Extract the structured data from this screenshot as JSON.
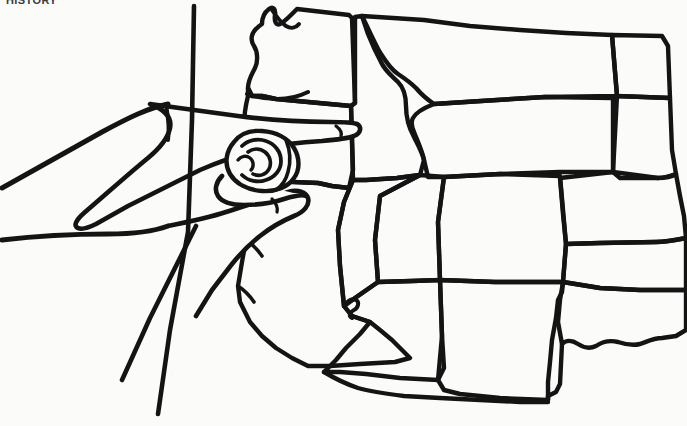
{
  "document": {
    "title": "Western United States outline map with pointing hand",
    "kind": "scanned line drawing",
    "background_color": "#fbfbfa",
    "ink_color": "#141414",
    "width_px": 687,
    "height_px": 426
  },
  "caption": {
    "clipped_header_text": "HISTORY",
    "note": "bold text fragment clipped at the very top edge of the scan"
  },
  "map": {
    "region_label": "Western United States",
    "style": "hand-drawn black outline, no fill, no labels printed on states",
    "states_depicted": [
      {
        "name": "Washington",
        "approx_center": [
          300,
          60
        ]
      },
      {
        "name": "Oregon",
        "approx_center": [
          288,
          145
        ]
      },
      {
        "name": "Idaho",
        "approx_center": [
          378,
          105
        ]
      },
      {
        "name": "Montana",
        "approx_center": [
          480,
          60
        ]
      },
      {
        "name": "North Dakota",
        "approx_center": [
          600,
          55
        ]
      },
      {
        "name": "South Dakota",
        "approx_center": [
          600,
          140
        ]
      },
      {
        "name": "Wyoming",
        "approx_center": [
          475,
          160
        ]
      },
      {
        "name": "Nebraska",
        "approx_center": [
          605,
          215
        ]
      },
      {
        "name": "Colorado",
        "approx_center": [
          490,
          245
        ]
      },
      {
        "name": "Kansas",
        "approx_center": [
          620,
          265
        ]
      },
      {
        "name": "Utah",
        "approx_center": [
          405,
          245
        ]
      },
      {
        "name": "Nevada",
        "approx_center": [
          330,
          250
        ]
      },
      {
        "name": "California",
        "approx_center": [
          280,
          285
        ]
      },
      {
        "name": "Arizona",
        "approx_center": [
          395,
          330
        ]
      },
      {
        "name": "New Mexico",
        "approx_center": [
          490,
          330
        ]
      },
      {
        "name": "Oklahoma",
        "approx_center": [
          620,
          330
        ]
      },
      {
        "name": "Texas panhandle",
        "approx_center": [
          590,
          385
        ]
      }
    ],
    "features": [
      "Puget Sound / Olympic Peninsula notch at upper left of Washington",
      "Snake River bend forming the Idaho panhandle and Oregon border",
      "Wyoming and Colorado drawn as near rectangles",
      "Four Corners junction where Utah, Colorado, Arizona and New Mexico meet",
      "Pacific coastline of California curving to the Mexico border",
      "Texas panhandle step and Oklahoma panhandle at lower right"
    ]
  },
  "hand": {
    "description": "A left hand in profile, fist closed with the index finger extended, pointing from the left side of the frame toward the map",
    "gesture": "index-finger point",
    "pointing_target_state": "Washington / Oregon / Idaho border area",
    "fingertip_position": [
      357,
      124
    ],
    "wrist_position": [
      150,
      215
    ],
    "elements": [
      "extended index finger",
      "curled middle, ring and little fingers",
      "thumb tucked below the index finger",
      "forearm running off the left edge of the frame",
      "cuff or sleeve lines crossing the forearm"
    ]
  },
  "stray_marks": {
    "description": "Two long ink strokes at the lower left that run off the bottom edge of the page",
    "count": 2
  }
}
